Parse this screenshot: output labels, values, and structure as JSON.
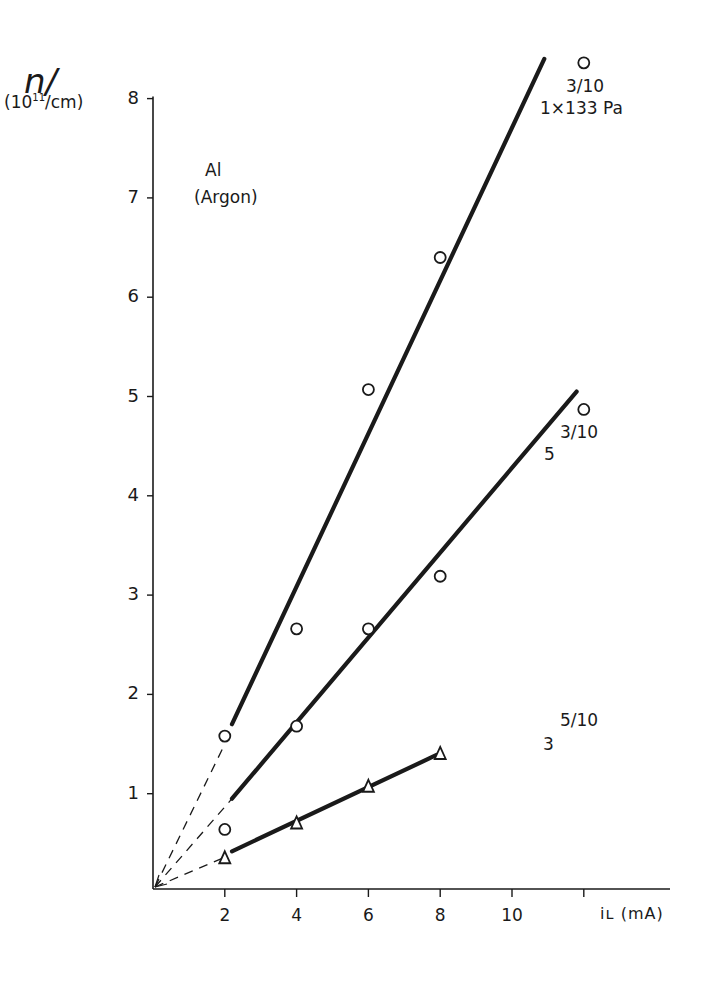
{
  "chart_data": {
    "type": "scatter",
    "title": "",
    "xlabel": "i_L (mA)",
    "ylabel": "n/ (10^11/cm)",
    "xlim": [
      0,
      14
    ],
    "ylim": [
      0,
      8
    ],
    "grid": false,
    "legend": "none (curves labeled inline)",
    "x_ticks": [
      2,
      4,
      6,
      8,
      10,
      12
    ],
    "x_tick_labels": [
      "2",
      "4",
      "6",
      "8",
      "10",
      ""
    ],
    "y_ticks": [
      1,
      2,
      3,
      4,
      5,
      6,
      7,
      8
    ],
    "y_tick_labels": [
      "1",
      "2",
      "3",
      "4",
      "5",
      "6",
      "7",
      "8"
    ],
    "annotations": [
      {
        "text": "Al",
        "x": 1.4,
        "y": 7.3
      },
      {
        "text": "(Argon)",
        "x": 1.4,
        "y": 7.0
      },
      {
        "text": "3/10",
        "x": 11.6,
        "y": 8.1
      },
      {
        "text": "1×133 Pa",
        "x": 11.5,
        "y": 7.8
      },
      {
        "text": "3/10",
        "x": 11.5,
        "y": 4.65
      },
      {
        "text": "5",
        "x": 11.0,
        "y": 4.4
      },
      {
        "text": "5/10",
        "x": 11.5,
        "y": 1.9
      },
      {
        "text": "3",
        "x": 10.5,
        "y": 1.6
      }
    ],
    "series": [
      {
        "name": "3/10, 1×133 Pa",
        "marker": "circle",
        "x": [
          2,
          4,
          6,
          8,
          12
        ],
        "y": [
          1.58,
          2.66,
          5.07,
          6.4,
          8.36
        ],
        "fit": {
          "solid_from": [
            2.2,
            1.7
          ],
          "solid_to": [
            10.9,
            8.4
          ],
          "dashed_from": [
            0,
            0
          ],
          "dashed_to": [
            2,
            1.5
          ]
        }
      },
      {
        "name": "3/10, 5×133 Pa",
        "marker": "circle",
        "x": [
          2,
          4,
          6,
          8,
          12
        ],
        "y": [
          0.64,
          1.68,
          2.66,
          3.19,
          4.87
        ],
        "fit": {
          "solid_from": [
            2.2,
            0.95
          ],
          "solid_to": [
            11.8,
            5.05
          ],
          "dashed_from": [
            0,
            0
          ],
          "dashed_to": [
            2.2,
            0.95
          ]
        }
      },
      {
        "name": "5/10, 3×133 Pa",
        "marker": "triangle",
        "x": [
          2,
          4,
          6,
          8
        ],
        "y": [
          0.36,
          0.71,
          1.08,
          1.41
        ],
        "fit": {
          "solid_from": [
            2.2,
            0.42
          ],
          "solid_to": [
            7.9,
            1.39
          ],
          "dashed_from": [
            0,
            0
          ],
          "dashed_to": [
            2,
            0.36
          ]
        }
      }
    ]
  },
  "labels": {
    "y_main": "n/",
    "y_unit_pre": "(10",
    "y_unit_sup": "11",
    "y_unit_post": "/cm)",
    "x_axis": "iʟ (mA)",
    "material": "Al",
    "gas": "(Argon)",
    "s1_ratio": "3/10",
    "s1_pressure": "1×133 Pa",
    "s2_ratio": "3/10",
    "s2_pressure": "5",
    "s3_ratio": "5/10",
    "s3_pressure": "3"
  },
  "style": {
    "ink": "#1a1a1a",
    "background": "#ffffff"
  }
}
